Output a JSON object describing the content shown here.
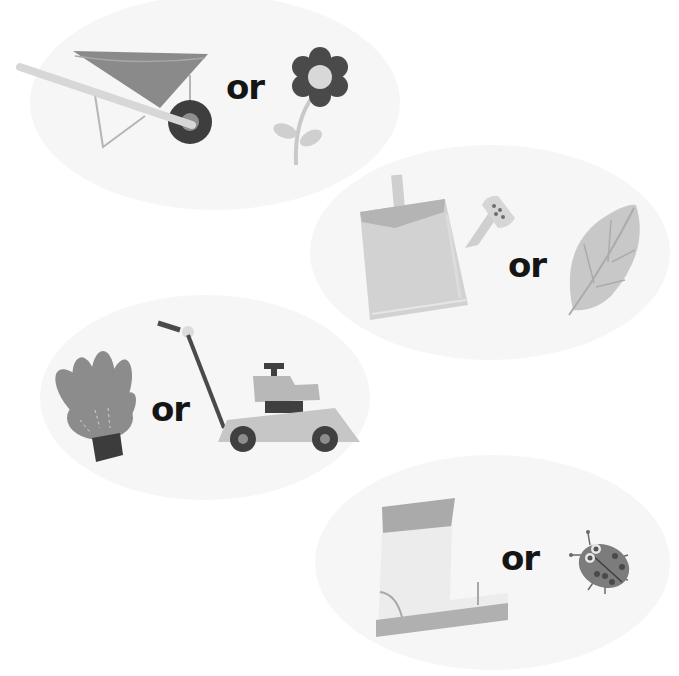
{
  "connector_word": "or",
  "pairs": [
    {
      "left": "wheelbarrow",
      "connector": "or",
      "right": "flower"
    },
    {
      "left": "watering-can",
      "connector": "or",
      "right": "leaf"
    },
    {
      "left": "gardening-glove",
      "connector": "or",
      "right": "lawn-mower"
    },
    {
      "left": "rain-boot",
      "connector": "or",
      "right": "ladybug"
    }
  ],
  "colors": {
    "background": "#ffffff",
    "blob": "#f6f6f6",
    "text": "#151515",
    "dark": "#4a4a4a",
    "mid": "#8a8a8a",
    "light": "#c8c8c8",
    "lighter": "#dedede"
  }
}
